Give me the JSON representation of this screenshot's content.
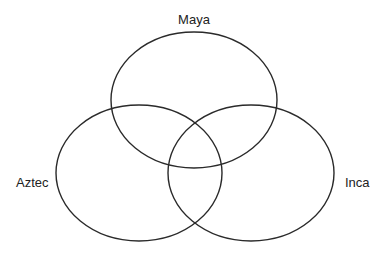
{
  "diagram": {
    "type": "venn",
    "sets": [
      {
        "id": "maya",
        "label": "Maya",
        "cx": 194,
        "cy": 100,
        "rx": 83,
        "ry": 68,
        "label_x": 194,
        "label_y": 24,
        "anchor": "middle"
      },
      {
        "id": "aztec",
        "label": "Aztec",
        "cx": 139,
        "cy": 173,
        "rx": 83,
        "ry": 68,
        "label_x": 16,
        "label_y": 187,
        "anchor": "start"
      },
      {
        "id": "inca",
        "label": "Inca",
        "cx": 251,
        "cy": 173,
        "rx": 83,
        "ry": 68,
        "label_x": 345,
        "label_y": 187,
        "anchor": "start"
      }
    ],
    "stroke_color": "#2a2a2a",
    "background": "#ffffff"
  }
}
